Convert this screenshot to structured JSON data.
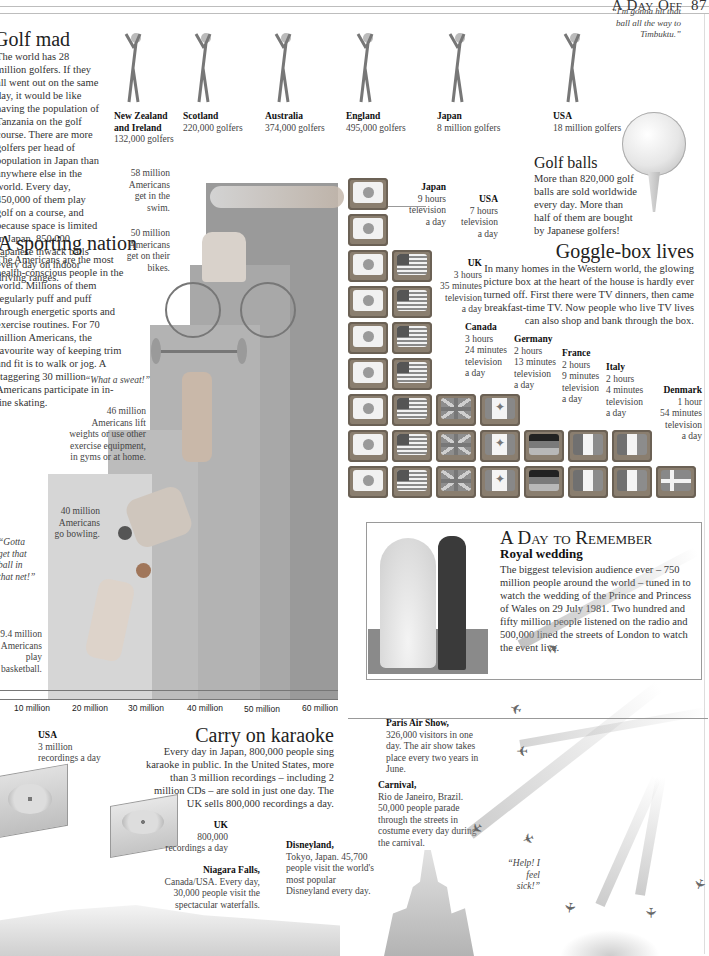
{
  "header": {
    "section": "A Day Off",
    "page_number": "87"
  },
  "golf_mad": {
    "title": "Golf mad",
    "body": "The world has 28 million golfers. If they all went out on the same day, it would be like having the population of Tanzania on the golf course. There are more golfers per head of population in Japan than anywhere else in the world. Every day, 450,000 of them play golf on a course, and because space is limited in Japan, 850,000 Japanese thwack balls every day on indoor driving ranges.",
    "golfers": [
      {
        "country": "New Zealand and Ireland",
        "value": "132,000 golfers"
      },
      {
        "country": "Scotland",
        "value": "220,000 golfers"
      },
      {
        "country": "Australia",
        "value": "374,000 golfers"
      },
      {
        "country": "England",
        "value": "495,000 golfers"
      },
      {
        "country": "Japan",
        "value": "8 million golfers"
      },
      {
        "country": "USA",
        "value": "18 million golfers"
      }
    ],
    "quote": "“I'm gonna hit that ball all the way to Timbuktu.”"
  },
  "golf_balls": {
    "title": "Golf balls",
    "body": "More than 820,000 golf balls are sold worldwide every day. More than half of them are bought by Japanese golfers!"
  },
  "sporting_nation": {
    "title": "A sporting nation",
    "body": "The Americans are the most health-conscious people in the world. Millions of them regularly puff and puff through energetic sports and exercise routines. For 70 million Americans, the favourite way of keeping trim and fit is to walk or jog. A staggering 30 million Americans participate in in-line skating.",
    "quotes": {
      "sweat": "“What a sweat!”",
      "basket": "“Gotta get that ball in that net!”"
    },
    "labels": {
      "swim": "58 million Americans get in the swim.",
      "bike": "50 million Americans get on their bikes.",
      "weights": "46 million Americans lift weights or use other exercise equipment, in gyms or at home.",
      "bowling": "40 million Americans go bowling.",
      "basketball": "29.4 million Americans play basketball."
    },
    "axis_ticks": [
      "10 million",
      "20 million",
      "30 million",
      "40 million",
      "50 million",
      "60 million"
    ]
  },
  "goggle_box": {
    "title": "Goggle-box lives",
    "body": "In many homes in the Western world, the glowing picture box at the heart of the house is hardly ever turned off. First there were TV dinners, then came breakfast-time TV. Now people who live TV lives can also shop and bank through the box.",
    "countries": [
      {
        "name": "Japan",
        "lines": [
          "9 hours",
          "television",
          "a day"
        ]
      },
      {
        "name": "USA",
        "lines": [
          "7 hours",
          "television",
          "a day"
        ]
      },
      {
        "name": "UK",
        "lines": [
          "3 hours",
          "35 minutes",
          "television",
          "a day"
        ]
      },
      {
        "name": "Canada",
        "lines": [
          "3 hours",
          "24 minutes",
          "television",
          "a day"
        ]
      },
      {
        "name": "Germany",
        "lines": [
          "2 hours",
          "13 minutes",
          "television",
          "a day"
        ]
      },
      {
        "name": "France",
        "lines": [
          "2 hours",
          "9 minutes",
          "television",
          "a day"
        ]
      },
      {
        "name": "Italy",
        "lines": [
          "2 hours",
          "4 minutes",
          "television",
          "a day"
        ]
      },
      {
        "name": "Denmark",
        "lines": [
          "1 hour",
          "54 minutes",
          "television",
          "a day"
        ]
      }
    ]
  },
  "day_to_remember": {
    "title": "A Day to Remember",
    "subtitle": "Royal wedding",
    "body": "The biggest television audience ever – 750 million people around the world – tuned in to watch the wedding of the Prince and Princess of Wales on 29 July 1981. Two hundred and fifty million people listened on the radio and 500,000 lined the streets of London to watch the event live."
  },
  "karaoke": {
    "title": "Carry on karaoke",
    "body": "Every day in Japan, 800,000 people sing karaoke in public. In the United States, more than 3 million recordings – including 2 million CDs – are sold in just one day. The UK sells 800,000 recordings a day.",
    "usa": {
      "name": "USA",
      "value": "3 million",
      "unit": "recordings a day"
    },
    "uk": {
      "name": "UK",
      "value": "800,000",
      "unit": "recordings a day"
    }
  },
  "attractions": {
    "paris": {
      "name": "Paris Air Show,",
      "text": "326,000 visitors in one day. The air show takes place every two years in June."
    },
    "carnival": {
      "name": "Carnival,",
      "text": "Rio de Janeiro, Brazil. 50,000 people parade through the streets in costume every day during the carnival."
    },
    "disneyland": {
      "name": "Disneyland,",
      "text": "Tokyo, Japan. 45,700 people visit the world's most popular Disneyland every day."
    },
    "niagara": {
      "name": "Niagara Falls,",
      "text": "Canada/USA. Every day, 30,000 people visit the spectacular waterfalls."
    },
    "help_quote": "“Help! I feel sick!”"
  },
  "colors": {
    "bar_dark": "#8f8f8f",
    "bar_mid": "#a9a9a9",
    "bar_light": "#c9c9c9",
    "rule": "#bdbdbd"
  }
}
